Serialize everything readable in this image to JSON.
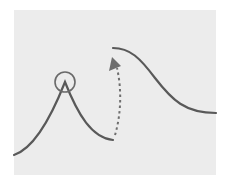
{
  "diagram": {
    "colors": {
      "background": "#ffffff",
      "panel": "#ececec",
      "stroke": "#595959",
      "arrow": "#6e6e6e"
    },
    "elements": {
      "left_curve": {
        "shape": "peak",
        "start": [
          14,
          155
        ],
        "peak": [
          65,
          82
        ],
        "end": [
          113,
          140
        ]
      },
      "peak_marker": {
        "shape": "circle",
        "center": [
          65,
          82
        ],
        "radius": 10
      },
      "right_curve": {
        "shape": "descending-sigmoid",
        "start": [
          113,
          48
        ],
        "end": [
          216,
          113
        ]
      },
      "transition_arrow": {
        "style": "dashed",
        "from": [
          115,
          135
        ],
        "to": [
          115,
          62
        ]
      }
    }
  }
}
